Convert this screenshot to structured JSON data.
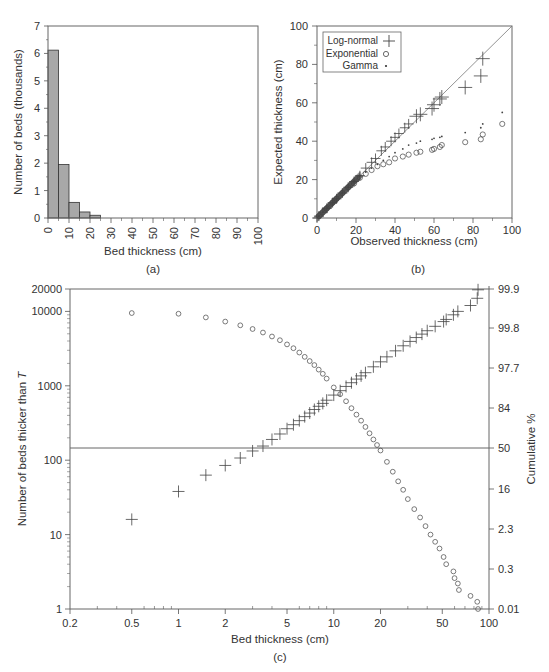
{
  "chart_data": [
    {
      "panel": "a",
      "type": "bar",
      "title": "",
      "panel_label": "(a)",
      "xlabel": "Bed thickness (cm)",
      "ylabel": "Number of beds (thousands)",
      "xlim": [
        0,
        100
      ],
      "ylim": [
        0,
        7
      ],
      "xticks": [
        0,
        10,
        20,
        30,
        40,
        50,
        60,
        70,
        80,
        90,
        100
      ],
      "yticks": [
        0,
        1,
        2,
        3,
        4,
        5,
        6,
        7
      ],
      "bin_width": 5,
      "categories": [
        "0-5",
        "5-10",
        "10-15",
        "15-20",
        "20-25"
      ],
      "bin_starts": [
        0,
        5,
        10,
        15,
        20
      ],
      "values": [
        6.12,
        1.95,
        0.57,
        0.22,
        0.1
      ],
      "bar_color": "#a8a8a8",
      "grid": false
    },
    {
      "panel": "b",
      "type": "scatter",
      "title": "",
      "panel_label": "(b)",
      "xlabel": "Observed thickness (cm)",
      "ylabel": "Expected thickness (cm)",
      "xlim": [
        0,
        100
      ],
      "ylim": [
        0,
        100
      ],
      "xticks": [
        0,
        20,
        40,
        60,
        80,
        100
      ],
      "yticks": [
        0,
        20,
        40,
        60,
        80,
        100
      ],
      "reference_line": "y = x",
      "legend": {
        "position": "upper left",
        "entries": [
          "Log-normal",
          "Exponential",
          "Gamma"
        ],
        "markers": [
          "plus",
          "circle",
          "dot"
        ]
      },
      "series": [
        {
          "name": "Log-normal",
          "marker": "plus",
          "x": [
            1,
            3,
            5,
            8,
            10,
            13,
            16,
            19,
            22,
            25,
            28,
            30,
            33,
            35,
            38,
            40,
            42,
            45,
            47,
            51,
            53,
            59,
            60,
            63,
            64,
            76,
            84,
            85
          ],
          "y": [
            1,
            3,
            5,
            8,
            10,
            13,
            16,
            19,
            22,
            26,
            29,
            31,
            35,
            37,
            40,
            42,
            44,
            47,
            49,
            53,
            54,
            57,
            59,
            62,
            63,
            68,
            74,
            83
          ]
        },
        {
          "name": "Exponential",
          "marker": "circle",
          "x": [
            1,
            3,
            5,
            8,
            10,
            13,
            16,
            19,
            22,
            25,
            28,
            31,
            34,
            37,
            40,
            44,
            47,
            51,
            53,
            59,
            60,
            63,
            64,
            76,
            84,
            85,
            95
          ],
          "y": [
            1,
            3,
            5,
            8,
            10,
            13,
            16,
            18,
            21,
            23,
            25,
            27,
            28,
            29,
            31,
            32,
            33,
            34,
            34.5,
            35.5,
            36,
            37,
            38,
            39.5,
            41,
            43.5,
            49
          ]
        },
        {
          "name": "Gamma",
          "marker": "dot",
          "x": [
            1,
            3,
            5,
            8,
            10,
            13,
            16,
            19,
            22,
            25,
            28,
            31,
            34,
            37,
            40,
            44,
            47,
            51,
            53,
            59,
            60,
            63,
            64,
            76,
            84,
            85,
            95
          ],
          "y": [
            1,
            3,
            5,
            8,
            10,
            13,
            16,
            19,
            22,
            24,
            26,
            28,
            30,
            32,
            34,
            36,
            38,
            39,
            40,
            41,
            41.5,
            42,
            42.5,
            44.5,
            47,
            49,
            55
          ]
        }
      ],
      "grid": false
    },
    {
      "panel": "c",
      "type": "scatter",
      "title": "",
      "panel_label": "(c)",
      "xlabel": "Bed thickness (cm)",
      "ylabel": "Number of beds thicker than T",
      "y2label": "Cumulative %",
      "xscale": "log",
      "yscale": "log",
      "xlim": [
        0.2,
        100
      ],
      "ylim": [
        1,
        20000
      ],
      "xticks": [
        0.2,
        0.5,
        1,
        2,
        5,
        10,
        20,
        50,
        100
      ],
      "yticks": [
        1,
        10,
        100,
        1000,
        10000,
        20000
      ],
      "y2ticks": [
        "0.01",
        "0.3",
        "2.3",
        "16",
        "50",
        "84",
        "97.7",
        "99.8",
        "99.9"
      ],
      "reference_line": "50% horizontal",
      "series": [
        {
          "name": "Number of beds thicker than T",
          "marker": "circle",
          "x": [
            0.5,
            1,
            1.5,
            2,
            2.5,
            3,
            3.5,
            4,
            4.5,
            5,
            5.5,
            6,
            6.5,
            7,
            7.5,
            8,
            8.5,
            9,
            10,
            11,
            12,
            13,
            14,
            15,
            16,
            17,
            18,
            19,
            20,
            22,
            24,
            26,
            28,
            30,
            33,
            36,
            39,
            42,
            45,
            48,
            51,
            53,
            59,
            60,
            63,
            64,
            76,
            84,
            85
          ],
          "y": [
            9500,
            9300,
            8300,
            7300,
            6500,
            5800,
            5200,
            4600,
            4100,
            3600,
            3200,
            2800,
            2450,
            2150,
            1900,
            1650,
            1450,
            1250,
            950,
            770,
            620,
            500,
            410,
            340,
            280,
            230,
            190,
            160,
            135,
            95,
            70,
            52,
            40,
            30,
            22,
            17,
            13,
            10,
            8,
            6.5,
            5,
            4,
            3.2,
            2.6,
            2.2,
            1.8,
            1.5,
            1.25,
            1
          ]
        },
        {
          "name": "Cumulative % (probability scale)",
          "marker": "plus",
          "x": [
            0.5,
            1,
            1.5,
            2,
            2.5,
            3,
            3.5,
            4,
            4.5,
            5,
            5.5,
            6,
            6.5,
            7,
            7.5,
            8,
            8.5,
            9,
            10,
            11,
            12,
            13,
            14,
            15,
            16,
            18,
            20,
            22,
            25,
            28,
            31,
            34,
            37,
            40,
            45,
            51,
            53,
            59,
            63,
            76,
            84,
            85
          ],
          "y": [
            16,
            38,
            63,
            85,
            107,
            133,
            155,
            190,
            225,
            265,
            300,
            340,
            385,
            430,
            480,
            530,
            580,
            640,
            750,
            860,
            980,
            1100,
            1230,
            1360,
            1500,
            1800,
            2100,
            2450,
            2950,
            3450,
            3950,
            4450,
            4950,
            5500,
            6300,
            7300,
            7800,
            9000,
            10000,
            12000,
            15000,
            19500
          ]
        }
      ],
      "grid": false
    }
  ],
  "labels": {
    "a": {
      "xlabel": "Bed thickness (cm)",
      "ylabel": "Number of beds (thousands)",
      "panel": "(a)",
      "xticks": [
        "0",
        "10",
        "20",
        "30",
        "40",
        "50",
        "60",
        "70",
        "80",
        "90",
        "100"
      ],
      "yticks": [
        "0",
        "1",
        "2",
        "3",
        "4",
        "5",
        "6",
        "7"
      ]
    },
    "b": {
      "xlabel": "Observed thickness (cm)",
      "ylabel": "Expected thickness (cm)",
      "panel": "(b)",
      "xticks": [
        "0",
        "20",
        "40",
        "60",
        "80",
        "100"
      ],
      "yticks": [
        "0",
        "20",
        "40",
        "60",
        "80",
        "100"
      ],
      "legend": [
        "Log-normal",
        "Exponential",
        "Gamma"
      ]
    },
    "c": {
      "xlabel": "Bed thickness (cm)",
      "ylabel_prefix": "Number of beds thicker than ",
      "ylabel_var": "T",
      "y2label": "Cumulative %",
      "panel": "(c)",
      "xticks": [
        "0.2",
        "0.5",
        "1",
        "2",
        "5",
        "10",
        "20",
        "50",
        "100"
      ],
      "yticks": [
        "1",
        "10",
        "100",
        "1000",
        "10000",
        "20000"
      ],
      "y2ticks": [
        "0.01",
        "0.3",
        "2.3",
        "16",
        "50",
        "84",
        "97.7",
        "99.8",
        "99.9"
      ]
    }
  },
  "colors": {
    "axis": "#555555",
    "bar_fill": "#a8a8a8",
    "bar_stroke": "#333333",
    "marker": "#444444",
    "text": "#333333"
  }
}
